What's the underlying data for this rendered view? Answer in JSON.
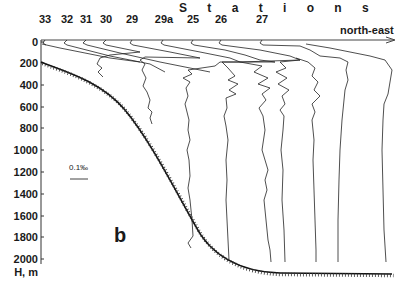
{
  "figure": {
    "panel_label": "b",
    "title": "S t a t i o n s",
    "direction_label": "north-east",
    "y_axis": {
      "label": "H, m",
      "ticks": [
        "0",
        "200",
        "400",
        "600",
        "800",
        "1000",
        "1200",
        "1400",
        "1600",
        "1800",
        "2000"
      ]
    },
    "scale_bar_label": "0.1‰",
    "stations": [
      {
        "id": "33"
      },
      {
        "id": "32"
      },
      {
        "id": "31"
      },
      {
        "id": "30"
      },
      {
        "id": "29"
      },
      {
        "id": "29a"
      },
      {
        "id": "25"
      },
      {
        "id": "26"
      },
      {
        "id": "27"
      }
    ],
    "colors": {
      "ink": "#1a1a1a",
      "background": "#ffffff"
    }
  }
}
